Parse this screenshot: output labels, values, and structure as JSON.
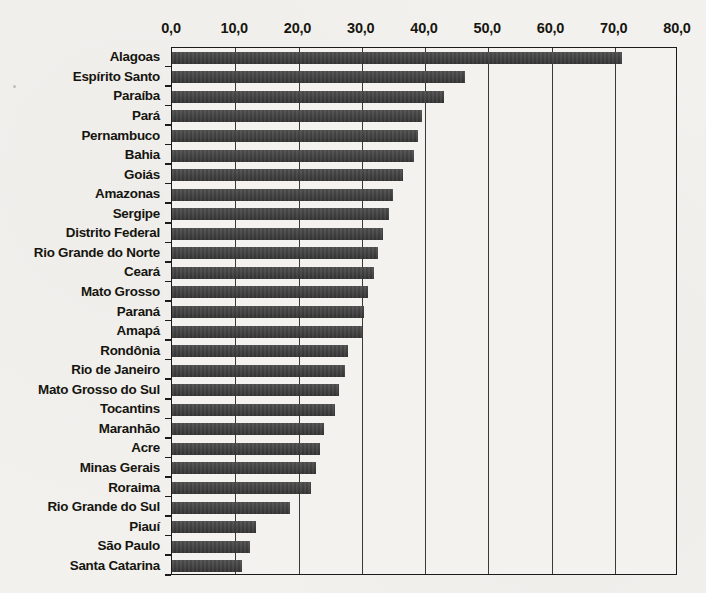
{
  "chart_data": {
    "type": "bar",
    "orientation": "horizontal",
    "title": "",
    "subtitle": "",
    "xlabel": "",
    "ylabel": "",
    "xlim": [
      0,
      80
    ],
    "xtick_step": 10,
    "grid": true,
    "legend": null,
    "decimal_separator": ",",
    "bar_color": "#3b3b3b",
    "axis_color": "#1b1b1b",
    "background_color": "#f3f1ee",
    "tick_labels": [
      "0,0",
      "10,0",
      "20,0",
      "30,0",
      "40,0",
      "50,0",
      "60,0",
      "70,0",
      "80,0"
    ],
    "tick_values": [
      0,
      10,
      20,
      30,
      40,
      50,
      60,
      70,
      80
    ],
    "categories": [
      "Alagoas",
      "Espírito Santo",
      "Paraíba",
      "Pará",
      "Pernambuco",
      "Bahia",
      "Goiás",
      "Amazonas",
      "Sergipe",
      "Distrito Federal",
      "Rio Grande do Norte",
      "Ceará",
      "Mato Grosso",
      "Paraná",
      "Amapá",
      "Rondônia",
      "Rio de Janeiro",
      "Mato Grosso do Sul",
      "Tocantins",
      "Maranhão",
      "Acre",
      "Minas Gerais",
      "Roraima",
      "Rio Grande do Sul",
      "Piauí",
      "São Paulo",
      "Santa Catarina"
    ],
    "values": [
      71.1,
      46.4,
      43.0,
      39.5,
      38.9,
      38.2,
      36.5,
      34.9,
      34.3,
      33.4,
      32.6,
      32.0,
      31.0,
      30.4,
      30.0,
      27.9,
      27.3,
      26.4,
      25.8,
      24.1,
      23.4,
      22.8,
      22.0,
      18.7,
      13.3,
      12.4,
      11.1
    ]
  }
}
